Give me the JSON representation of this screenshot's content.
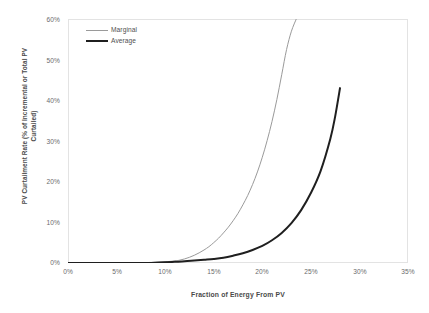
{
  "chart_data": {
    "type": "line",
    "title": "",
    "xlabel": "Fraction of Energy From PV",
    "ylabel": "PV Curtailment Rate (% of Incremental or Total PV Curtailed)",
    "ylabel_line1": "PV Curtailment Rate (% of Incremental or Total PV",
    "ylabel_line2": "Curtailed)",
    "xlim": [
      0,
      35
    ],
    "ylim": [
      0,
      60
    ],
    "xticks": [
      "0%",
      "5%",
      "10%",
      "15%",
      "20%",
      "25%",
      "30%",
      "35%"
    ],
    "xtick_values": [
      0,
      5,
      10,
      15,
      20,
      25,
      30,
      35
    ],
    "yticks": [
      "0%",
      "10%",
      "20%",
      "30%",
      "40%",
      "50%",
      "60%"
    ],
    "ytick_values": [
      0,
      10,
      20,
      30,
      40,
      50,
      60
    ],
    "grid": false,
    "legend_position": "upper left inside",
    "series": [
      {
        "name": "Marginal",
        "color": "#9a9a9a",
        "width": 1,
        "x": [
          0,
          2,
          4,
          6,
          8,
          9,
          10,
          11,
          11.5,
          12,
          12.5,
          13,
          13.5,
          14,
          14.5,
          15,
          15.5,
          16,
          16.5,
          17,
          17.5,
          18,
          18.5,
          19,
          19.5,
          20,
          20.5,
          21,
          21.5,
          22,
          22.5,
          23,
          23.5
        ],
        "y": [
          0,
          0,
          0,
          0,
          0.1,
          0.2,
          0.3,
          0.5,
          0.7,
          1.0,
          1.4,
          1.9,
          2.5,
          3.2,
          4.0,
          5.0,
          6.1,
          7.4,
          8.8,
          10.4,
          12.2,
          14.3,
          16.6,
          19.3,
          22.4,
          26.0,
          30.1,
          34.8,
          40.2,
          46.3,
          52.5,
          57.0,
          60.0
        ]
      },
      {
        "name": "Average",
        "color": "#1f1f1f",
        "width": 2,
        "x": [
          0,
          2,
          4,
          6,
          8,
          10,
          11,
          12,
          13,
          14,
          15,
          16,
          17,
          18,
          19,
          20,
          21,
          22,
          23,
          24,
          25,
          26,
          27,
          27.5,
          28
        ],
        "y": [
          0,
          0,
          0,
          0,
          0,
          0.2,
          0.3,
          0.4,
          0.6,
          0.8,
          1.0,
          1.3,
          1.8,
          2.4,
          3.2,
          4.2,
          5.6,
          7.4,
          9.8,
          13.0,
          17.2,
          22.6,
          30.5,
          36.0,
          43.0
        ]
      }
    ],
    "legend": [
      "Marginal",
      "Average"
    ]
  },
  "legend": {
    "items": [
      {
        "label": "Marginal"
      },
      {
        "label": "Average"
      }
    ]
  }
}
